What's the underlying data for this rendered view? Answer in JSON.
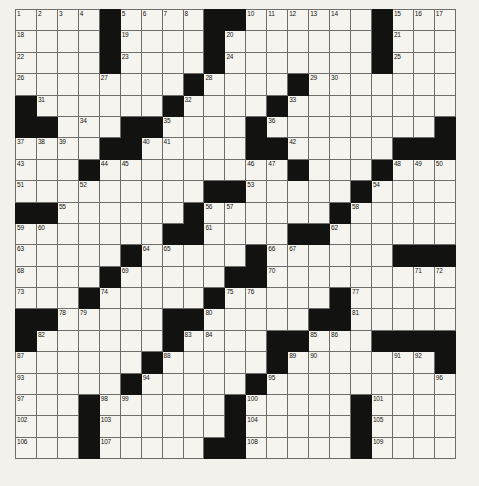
{
  "puzzle": {
    "type": "crossword-grid",
    "rows": 21,
    "cols": 21,
    "cell_size_px": 21,
    "colors": {
      "page_background": "#f2f1ec",
      "cell_fill": "#f5f4ef",
      "block_fill": "#121210",
      "grid_line": "#6e6e6c",
      "outer_border": "#3a3a38",
      "number_text": "#15150f"
    },
    "grid_origin": {
      "x": 15,
      "y": 9
    },
    "block_cells": [
      [
        0,
        4
      ],
      [
        0,
        9
      ],
      [
        0,
        10
      ],
      [
        0,
        17
      ],
      [
        1,
        4
      ],
      [
        1,
        9
      ],
      [
        1,
        17
      ],
      [
        2,
        4
      ],
      [
        2,
        9
      ],
      [
        2,
        17
      ],
      [
        3,
        8
      ],
      [
        3,
        13
      ],
      [
        4,
        0
      ],
      [
        4,
        7
      ],
      [
        4,
        12
      ],
      [
        5,
        0
      ],
      [
        5,
        1
      ],
      [
        5,
        5
      ],
      [
        5,
        6
      ],
      [
        5,
        11
      ],
      [
        5,
        20
      ],
      [
        6,
        4
      ],
      [
        6,
        5
      ],
      [
        6,
        11
      ],
      [
        6,
        12
      ],
      [
        6,
        18
      ],
      [
        6,
        19
      ],
      [
        6,
        20
      ],
      [
        7,
        3
      ],
      [
        7,
        13
      ],
      [
        7,
        17
      ],
      [
        8,
        9
      ],
      [
        8,
        10
      ],
      [
        8,
        16
      ],
      [
        9,
        0
      ],
      [
        9,
        1
      ],
      [
        9,
        8
      ],
      [
        9,
        15
      ],
      [
        10,
        7
      ],
      [
        10,
        8
      ],
      [
        10,
        13
      ],
      [
        10,
        14
      ],
      [
        11,
        5
      ],
      [
        11,
        11
      ],
      [
        11,
        18
      ],
      [
        11,
        19
      ],
      [
        11,
        20
      ],
      [
        12,
        4
      ],
      [
        12,
        10
      ],
      [
        12,
        11
      ],
      [
        13,
        3
      ],
      [
        13,
        9
      ],
      [
        13,
        15
      ],
      [
        14,
        0
      ],
      [
        14,
        1
      ],
      [
        14,
        7
      ],
      [
        14,
        8
      ],
      [
        14,
        14
      ],
      [
        14,
        15
      ],
      [
        15,
        0
      ],
      [
        15,
        7
      ],
      [
        15,
        12
      ],
      [
        15,
        13
      ],
      [
        15,
        17
      ],
      [
        15,
        18
      ],
      [
        15,
        19
      ],
      [
        15,
        20
      ],
      [
        16,
        6
      ],
      [
        16,
        12
      ],
      [
        16,
        20
      ],
      [
        17,
        5
      ],
      [
        17,
        11
      ],
      [
        18,
        3
      ],
      [
        18,
        10
      ],
      [
        18,
        16
      ],
      [
        19,
        3
      ],
      [
        19,
        10
      ],
      [
        19,
        16
      ],
      [
        20,
        3
      ],
      [
        20,
        9
      ],
      [
        20,
        10
      ],
      [
        20,
        16
      ]
    ],
    "numbers": [
      {
        "r": 0,
        "c": 0,
        "n": "1"
      },
      {
        "r": 0,
        "c": 1,
        "n": "2"
      },
      {
        "r": 0,
        "c": 2,
        "n": "3"
      },
      {
        "r": 0,
        "c": 3,
        "n": "4"
      },
      {
        "r": 0,
        "c": 5,
        "n": "5"
      },
      {
        "r": 0,
        "c": 6,
        "n": "6"
      },
      {
        "r": 0,
        "c": 7,
        "n": "7"
      },
      {
        "r": 0,
        "c": 8,
        "n": "8"
      },
      {
        "r": 0,
        "c": 9,
        "n": "9"
      },
      {
        "r": 0,
        "c": 11,
        "n": "10"
      },
      {
        "r": 0,
        "c": 12,
        "n": "11"
      },
      {
        "r": 0,
        "c": 13,
        "n": "12"
      },
      {
        "r": 0,
        "c": 14,
        "n": "13"
      },
      {
        "r": 0,
        "c": 15,
        "n": "14"
      },
      {
        "r": 0,
        "c": 18,
        "n": "15"
      },
      {
        "r": 0,
        "c": 19,
        "n": "16"
      },
      {
        "r": 0,
        "c": 20,
        "n": "17"
      },
      {
        "r": 1,
        "c": 0,
        "n": "18"
      },
      {
        "r": 1,
        "c": 5,
        "n": "19"
      },
      {
        "r": 1,
        "c": 10,
        "n": "20"
      },
      {
        "r": 1,
        "c": 18,
        "n": "21"
      },
      {
        "r": 2,
        "c": 0,
        "n": "22"
      },
      {
        "r": 2,
        "c": 5,
        "n": "23"
      },
      {
        "r": 2,
        "c": 10,
        "n": "24"
      },
      {
        "r": 2,
        "c": 18,
        "n": "25"
      },
      {
        "r": 3,
        "c": 0,
        "n": "26"
      },
      {
        "r": 3,
        "c": 4,
        "n": "27"
      },
      {
        "r": 3,
        "c": 9,
        "n": "28"
      },
      {
        "r": 3,
        "c": 14,
        "n": "29"
      },
      {
        "r": 3,
        "c": 15,
        "n": "30"
      },
      {
        "r": 4,
        "c": 1,
        "n": "31"
      },
      {
        "r": 4,
        "c": 8,
        "n": "32"
      },
      {
        "r": 4,
        "c": 13,
        "n": "33"
      },
      {
        "r": 5,
        "c": 3,
        "n": "34"
      },
      {
        "r": 5,
        "c": 7,
        "n": "35"
      },
      {
        "r": 5,
        "c": 12,
        "n": "36"
      },
      {
        "r": 6,
        "c": 0,
        "n": "37"
      },
      {
        "r": 6,
        "c": 1,
        "n": "38"
      },
      {
        "r": 6,
        "c": 2,
        "n": "39"
      },
      {
        "r": 6,
        "c": 6,
        "n": "40"
      },
      {
        "r": 6,
        "c": 7,
        "n": "41"
      },
      {
        "r": 6,
        "c": 13,
        "n": "42"
      },
      {
        "r": 7,
        "c": 0,
        "n": "43"
      },
      {
        "r": 7,
        "c": 4,
        "n": "44"
      },
      {
        "r": 7,
        "c": 5,
        "n": "45"
      },
      {
        "r": 7,
        "c": 11,
        "n": "46"
      },
      {
        "r": 7,
        "c": 12,
        "n": "47"
      },
      {
        "r": 7,
        "c": 18,
        "n": "48"
      },
      {
        "r": 7,
        "c": 19,
        "n": "49"
      },
      {
        "r": 7,
        "c": 20,
        "n": "50"
      },
      {
        "r": 8,
        "c": 0,
        "n": "51"
      },
      {
        "r": 8,
        "c": 3,
        "n": "52"
      },
      {
        "r": 8,
        "c": 11,
        "n": "53"
      },
      {
        "r": 8,
        "c": 17,
        "n": "54"
      },
      {
        "r": 9,
        "c": 2,
        "n": "55"
      },
      {
        "r": 9,
        "c": 9,
        "n": "56"
      },
      {
        "r": 9,
        "c": 10,
        "n": "57"
      },
      {
        "r": 9,
        "c": 16,
        "n": "58"
      },
      {
        "r": 10,
        "c": 0,
        "n": "59"
      },
      {
        "r": 10,
        "c": 1,
        "n": "60"
      },
      {
        "r": 10,
        "c": 9,
        "n": "61"
      },
      {
        "r": 10,
        "c": 15,
        "n": "62"
      },
      {
        "r": 11,
        "c": 0,
        "n": "63"
      },
      {
        "r": 11,
        "c": 6,
        "n": "64"
      },
      {
        "r": 11,
        "c": 7,
        "n": "65"
      },
      {
        "r": 11,
        "c": 12,
        "n": "66"
      },
      {
        "r": 11,
        "c": 13,
        "n": "67"
      },
      {
        "r": 12,
        "c": 0,
        "n": "68"
      },
      {
        "r": 12,
        "c": 5,
        "n": "69"
      },
      {
        "r": 12,
        "c": 12,
        "n": "70"
      },
      {
        "r": 12,
        "c": 19,
        "n": "71"
      },
      {
        "r": 12,
        "c": 20,
        "n": "72"
      },
      {
        "r": 13,
        "c": 0,
        "n": "73"
      },
      {
        "r": 13,
        "c": 4,
        "n": "74"
      },
      {
        "r": 13,
        "c": 10,
        "n": "75"
      },
      {
        "r": 13,
        "c": 11,
        "n": "76"
      },
      {
        "r": 13,
        "c": 16,
        "n": "77"
      },
      {
        "r": 14,
        "c": 2,
        "n": "78"
      },
      {
        "r": 14,
        "c": 3,
        "n": "79"
      },
      {
        "r": 14,
        "c": 9,
        "n": "80"
      },
      {
        "r": 14,
        "c": 16,
        "n": "81"
      },
      {
        "r": 15,
        "c": 1,
        "n": "82"
      },
      {
        "r": 15,
        "c": 8,
        "n": "83"
      },
      {
        "r": 15,
        "c": 9,
        "n": "84"
      },
      {
        "r": 15,
        "c": 14,
        "n": "85"
      },
      {
        "r": 15,
        "c": 15,
        "n": "86"
      },
      {
        "r": 16,
        "c": 0,
        "n": "87"
      },
      {
        "r": 16,
        "c": 7,
        "n": "88"
      },
      {
        "r": 16,
        "c": 13,
        "n": "89"
      },
      {
        "r": 16,
        "c": 14,
        "n": "90"
      },
      {
        "r": 16,
        "c": 18,
        "n": "91"
      },
      {
        "r": 16,
        "c": 19,
        "n": "92"
      },
      {
        "r": 17,
        "c": 0,
        "n": "93"
      },
      {
        "r": 17,
        "c": 6,
        "n": "94"
      },
      {
        "r": 17,
        "c": 12,
        "n": "95"
      },
      {
        "r": 17,
        "c": 20,
        "n": "96"
      },
      {
        "r": 18,
        "c": 0,
        "n": "97"
      },
      {
        "r": 18,
        "c": 4,
        "n": "98"
      },
      {
        "r": 18,
        "c": 5,
        "n": "99"
      },
      {
        "r": 18,
        "c": 11,
        "n": "100"
      },
      {
        "r": 18,
        "c": 17,
        "n": "101"
      },
      {
        "r": 19,
        "c": 0,
        "n": "102"
      },
      {
        "r": 19,
        "c": 4,
        "n": "103"
      },
      {
        "r": 19,
        "c": 11,
        "n": "104"
      },
      {
        "r": 19,
        "c": 17,
        "n": "105"
      },
      {
        "r": 20,
        "c": 0,
        "n": "106"
      },
      {
        "r": 20,
        "c": 4,
        "n": "107"
      },
      {
        "r": 20,
        "c": 11,
        "n": "108"
      },
      {
        "r": 20,
        "c": 17,
        "n": "109"
      }
    ]
  }
}
